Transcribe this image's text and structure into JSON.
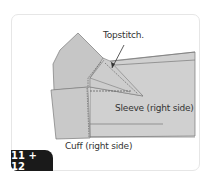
{
  "diagram": {
    "step_badge": "11 + 12",
    "labels": {
      "topstitch": "Topstitch.",
      "sleeve": "Sleeve (right side)",
      "cuff": "Cuff (right side)"
    },
    "colors": {
      "fabric": "#c8c8c8",
      "fabric_light": "#d4d4d4",
      "outline": "#7a7a7a",
      "stitch": "#555555",
      "badge_bg": "#1a1a1a",
      "badge_text": "#ffffff"
    }
  }
}
